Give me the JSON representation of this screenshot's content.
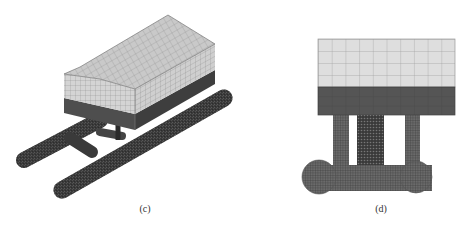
{
  "figure": {
    "panels": [
      {
        "id": "c",
        "caption": "(c)",
        "view": "isometric",
        "description": "Finite element mesh of box-shaped deck on twin pipe pontoons"
      },
      {
        "id": "d",
        "caption": "(d)",
        "view": "side elevation",
        "description": "Finite element mesh of deck with dark band, three vertical legs and transverse pipe with circular ends"
      }
    ],
    "colors": {
      "deck_light": "#d8d8d8",
      "deck_light_top": "#c4c4c4",
      "deck_dark": "#5a5a5a",
      "pipe": "#3c3c3c",
      "mesh_line": "#8a8a8a",
      "background": "#ffffff"
    }
  }
}
